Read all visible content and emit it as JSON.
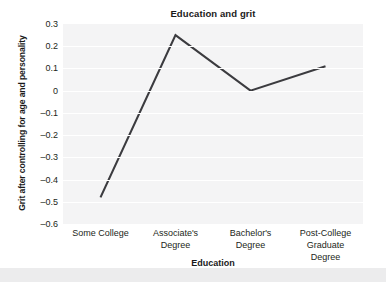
{
  "chart_data": {
    "type": "line",
    "title": "Education and grit",
    "xlabel": "Education",
    "ylabel": "Grit after controlling for age and personality",
    "categories": [
      "Some College",
      "Associate's Degree",
      "Bachelor's Degree",
      "Post-College Graduate Degree"
    ],
    "category_lines": [
      [
        "Some College"
      ],
      [
        "Associate's",
        "Degree"
      ],
      [
        "Bachelor's",
        "Degree"
      ],
      [
        "Post-College Graduate",
        "Degree"
      ]
    ],
    "values": [
      -0.48,
      0.25,
      0.0,
      0.11
    ],
    "ylim": [
      -0.6,
      0.3
    ],
    "ytick_values": [
      0.3,
      0.2,
      0.1,
      0,
      -0.1,
      -0.2,
      -0.3,
      -0.4,
      -0.5,
      -0.6
    ],
    "ytick_labels": [
      "0.3",
      "0.2",
      "0.1",
      "0",
      "–0.1",
      "–0.2",
      "–0.3",
      "–0.4",
      "–0.5",
      "–0.6"
    ],
    "grid": true,
    "legend": "none",
    "line_color": "#3b3b3f",
    "plot_background": "#f4f4f5",
    "figure_background": "#ffffff",
    "text_color": "#231f20"
  }
}
